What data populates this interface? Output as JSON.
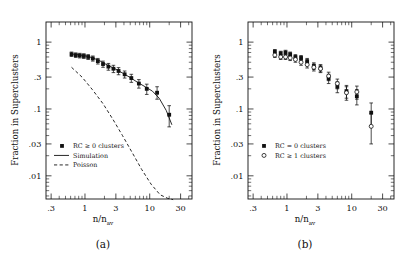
{
  "figure": {
    "background_color": "#ffffff",
    "ink_color": "#111111"
  },
  "panels": [
    {
      "id": "a",
      "caption": "(a)",
      "xlabel_main": "n/n",
      "xlabel_sub": "av",
      "ylabel": "Fraction in Superclusters",
      "legend": [
        {
          "label": "RC ≥ 0 clusters",
          "marker": "filled-square"
        },
        {
          "label": "Simulation",
          "marker": "solid-line"
        },
        {
          "label": "Poisson",
          "marker": "dashed-line"
        }
      ]
    },
    {
      "id": "b",
      "caption": "(b)",
      "xlabel_main": "n/n",
      "xlabel_sub": "av",
      "ylabel": "Fraction in Superclusters",
      "legend": [
        {
          "label": "RC = 0 clusters",
          "marker": "filled-square"
        },
        {
          "label": "RC ≥ 1 clusters",
          "marker": "open-circle"
        }
      ]
    }
  ],
  "chart_data": [
    {
      "type": "scatter",
      "panel": "a",
      "title": "",
      "xlabel": "n/n_av",
      "ylabel": "Fraction in Superclusters",
      "xscale": "log",
      "yscale": "log",
      "xlim": [
        0.25,
        45
      ],
      "ylim": [
        0.0045,
        2.0
      ],
      "xticks": [
        0.3,
        1,
        3,
        10,
        30
      ],
      "xticklabels": [
        ".3",
        "1",
        "3",
        "10",
        "30"
      ],
      "yticks": [
        1,
        0.3,
        0.1,
        0.03,
        0.01
      ],
      "yticklabels": [
        "1",
        ".3",
        ".1",
        ".03",
        ".01"
      ],
      "grid": false,
      "legend_position": "lower-left",
      "series": [
        {
          "name": "RC ≥ 0 clusters",
          "marker": "filled-square",
          "x": [
            0.62,
            0.72,
            0.83,
            0.96,
            1.12,
            1.32,
            1.58,
            1.9,
            2.3,
            2.75,
            3.3,
            4.1,
            5.2,
            6.8,
            9.0,
            13.0,
            20.0
          ],
          "y": [
            0.66,
            0.64,
            0.63,
            0.62,
            0.6,
            0.57,
            0.52,
            0.47,
            0.43,
            0.4,
            0.37,
            0.33,
            0.29,
            0.24,
            0.2,
            0.175,
            0.082
          ],
          "yerr_low": [
            0.05,
            0.05,
            0.05,
            0.05,
            0.05,
            0.05,
            0.05,
            0.05,
            0.05,
            0.05,
            0.045,
            0.04,
            0.04,
            0.035,
            0.035,
            0.035,
            0.028
          ],
          "yerr_high": [
            0.05,
            0.05,
            0.05,
            0.05,
            0.05,
            0.05,
            0.05,
            0.05,
            0.05,
            0.05,
            0.045,
            0.04,
            0.04,
            0.035,
            0.035,
            0.04,
            0.03
          ]
        }
      ],
      "curves": [
        {
          "name": "Simulation",
          "style": "solid",
          "x": [
            0.62,
            0.8,
            1.0,
            1.3,
            1.7,
            2.2,
            2.9,
            3.8,
            5.0,
            6.5,
            8.5,
            11.0,
            14.0,
            18.0,
            22.0
          ],
          "y": [
            0.665,
            0.645,
            0.625,
            0.585,
            0.525,
            0.455,
            0.4,
            0.345,
            0.295,
            0.25,
            0.215,
            0.185,
            0.145,
            0.095,
            0.058
          ]
        },
        {
          "name": "Poisson",
          "style": "dashed",
          "x": [
            0.62,
            0.9,
            1.3,
            1.9,
            2.7,
            3.8,
            5.4,
            7.5,
            10.5,
            14.5,
            19.0,
            23.0
          ],
          "y": [
            0.42,
            0.3,
            0.195,
            0.12,
            0.07,
            0.04,
            0.022,
            0.0125,
            0.0075,
            0.0052,
            0.0046,
            0.0044
          ]
        }
      ]
    },
    {
      "type": "scatter",
      "panel": "b",
      "title": "",
      "xlabel": "n/n_av",
      "ylabel": "Fraction in Superclusters",
      "xscale": "log",
      "yscale": "log",
      "xlim": [
        0.25,
        45
      ],
      "ylim": [
        0.0045,
        2.0
      ],
      "xticks": [
        0.3,
        1,
        3,
        10,
        30
      ],
      "xticklabels": [
        ".3",
        "1",
        "3",
        "10",
        "30"
      ],
      "yticks": [
        1,
        0.3,
        0.1,
        0.03,
        0.01
      ],
      "yticklabels": [
        "1",
        ".3",
        ".1",
        ".03",
        ".01"
      ],
      "grid": false,
      "legend_position": "lower-left",
      "series": [
        {
          "name": "RC = 0 clusters",
          "marker": "filled-square",
          "x": [
            0.65,
            0.8,
            0.95,
            1.12,
            1.35,
            1.65,
            2.05,
            2.6,
            3.3,
            4.4,
            6.0,
            8.3,
            12.0,
            20.0
          ],
          "y": [
            0.72,
            0.68,
            0.7,
            0.66,
            0.6,
            0.58,
            0.52,
            0.44,
            0.41,
            0.285,
            0.215,
            0.185,
            0.155,
            0.088
          ],
          "yerr_low": [
            0.055,
            0.05,
            0.055,
            0.05,
            0.05,
            0.05,
            0.05,
            0.05,
            0.05,
            0.045,
            0.04,
            0.04,
            0.04,
            0.032
          ],
          "yerr_high": [
            0.055,
            0.05,
            0.055,
            0.05,
            0.05,
            0.05,
            0.05,
            0.05,
            0.05,
            0.045,
            0.04,
            0.04,
            0.04,
            0.035
          ]
        },
        {
          "name": "RC ≥ 1 clusters",
          "marker": "open-circle",
          "x": [
            0.65,
            0.8,
            0.95,
            1.12,
            1.35,
            1.65,
            2.05,
            2.6,
            3.3,
            4.4,
            6.0,
            8.3,
            12.0,
            20.0
          ],
          "y": [
            0.64,
            0.6,
            0.6,
            0.58,
            0.55,
            0.5,
            0.46,
            0.42,
            0.4,
            0.31,
            0.24,
            0.175,
            0.18,
            0.055
          ],
          "yerr_low": [
            0.05,
            0.05,
            0.05,
            0.05,
            0.05,
            0.05,
            0.05,
            0.05,
            0.05,
            0.045,
            0.04,
            0.04,
            0.04,
            0.025
          ],
          "yerr_high": [
            0.05,
            0.05,
            0.05,
            0.05,
            0.05,
            0.05,
            0.05,
            0.05,
            0.05,
            0.045,
            0.04,
            0.04,
            0.04,
            0.03
          ]
        }
      ]
    }
  ]
}
